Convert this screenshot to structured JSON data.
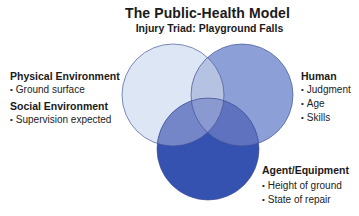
{
  "title": "The Public-Health Model",
  "subtitle": "Injury Triad: Playground Falls",
  "colors": {
    "environment_circle": "#dce6f4",
    "human_circle": "#8c9fd6",
    "agent_circle": "#3552b0",
    "env_human_overlap": "#b6c2e2",
    "env_agent_overlap": "#7486c8",
    "human_agent_overlap": "#5f72bf",
    "center_overlap": "#8a9ad0",
    "outline": "#3d4f94"
  },
  "circles": [
    {
      "name": "Environment",
      "cx": 173,
      "cy": 95,
      "r": 51
    },
    {
      "name": "Human",
      "cx": 242,
      "cy": 95,
      "r": 51
    },
    {
      "name": "Agent/Equipment",
      "cx": 208,
      "cy": 149,
      "r": 51
    }
  ],
  "groups": {
    "environment": {
      "physical": {
        "heading": "Physical Environment",
        "items": [
          "Ground surface"
        ]
      },
      "social": {
        "heading": "Social Environment",
        "items": [
          "Supervision expected"
        ]
      }
    },
    "human": {
      "heading": "Human",
      "items": [
        "Judgment",
        "Age",
        "Skills"
      ]
    },
    "agent": {
      "heading": "Agent/Equipment",
      "items": [
        "Height of ground",
        "State of repair"
      ]
    }
  }
}
